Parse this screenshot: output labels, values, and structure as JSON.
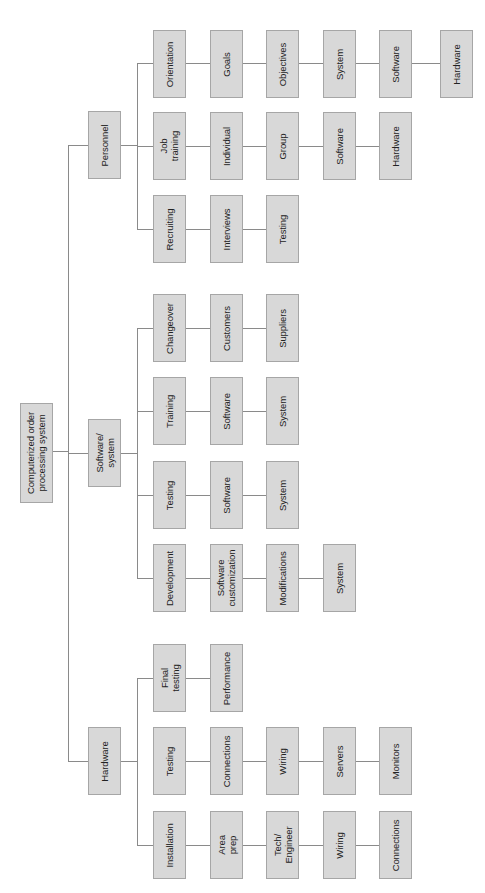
{
  "diagram": {
    "type": "work-breakdown-structure",
    "orientation": "rotated-90-ccw",
    "colors": {
      "box_fill": "#d8d8d8",
      "box_border": "#a6a6a6",
      "line": "#8a8a8a",
      "text": "#222222"
    },
    "root": {
      "id": "root",
      "label": "Computerized order\nprocessing system",
      "x": 20,
      "y": 403,
      "w": 33,
      "h": 100
    },
    "nodes": [
      {
        "id": "personnel",
        "label": "Personnel",
        "x": 88,
        "y": 111,
        "w": 33,
        "h": 68
      },
      {
        "id": "software-system",
        "label": "Software/\nsystem",
        "x": 88,
        "y": 419,
        "w": 33,
        "h": 68
      },
      {
        "id": "hardware",
        "label": "Hardware",
        "x": 88,
        "y": 727,
        "w": 33,
        "h": 68
      },
      {
        "id": "p-orientation",
        "label": "Orientation",
        "x": 153,
        "y": 30,
        "w": 33,
        "h": 68
      },
      {
        "id": "p-goals",
        "label": "Goals",
        "x": 210,
        "y": 30,
        "w": 33,
        "h": 68
      },
      {
        "id": "p-objectives",
        "label": "Objectives",
        "x": 266,
        "y": 30,
        "w": 33,
        "h": 68
      },
      {
        "id": "p-o-system",
        "label": "System",
        "x": 323,
        "y": 30,
        "w": 33,
        "h": 68
      },
      {
        "id": "p-o-software",
        "label": "Software",
        "x": 379,
        "y": 30,
        "w": 33,
        "h": 68
      },
      {
        "id": "p-o-hardware",
        "label": "Hardware",
        "x": 440,
        "y": 30,
        "w": 33,
        "h": 68
      },
      {
        "id": "p-job-training",
        "label": "Job\ntraining",
        "x": 153,
        "y": 112,
        "w": 33,
        "h": 68
      },
      {
        "id": "p-individual",
        "label": "Individual",
        "x": 210,
        "y": 112,
        "w": 33,
        "h": 68
      },
      {
        "id": "p-group",
        "label": "Group",
        "x": 266,
        "y": 112,
        "w": 33,
        "h": 68
      },
      {
        "id": "p-j-software",
        "label": "Software",
        "x": 323,
        "y": 112,
        "w": 33,
        "h": 68
      },
      {
        "id": "p-j-hardware",
        "label": "Hardware",
        "x": 379,
        "y": 112,
        "w": 33,
        "h": 68
      },
      {
        "id": "p-recruiting",
        "label": "Recruiting",
        "x": 153,
        "y": 195,
        "w": 33,
        "h": 68
      },
      {
        "id": "p-interviews",
        "label": "Interviews",
        "x": 210,
        "y": 195,
        "w": 33,
        "h": 68
      },
      {
        "id": "p-r-testing",
        "label": "Testing",
        "x": 266,
        "y": 195,
        "w": 33,
        "h": 68
      },
      {
        "id": "s-changeover",
        "label": "Changeover",
        "x": 153,
        "y": 294,
        "w": 33,
        "h": 68
      },
      {
        "id": "s-customers",
        "label": "Customers",
        "x": 210,
        "y": 294,
        "w": 33,
        "h": 68
      },
      {
        "id": "s-suppliers",
        "label": "Suppliers",
        "x": 266,
        "y": 294,
        "w": 33,
        "h": 68
      },
      {
        "id": "s-training",
        "label": "Training",
        "x": 153,
        "y": 377,
        "w": 33,
        "h": 68
      },
      {
        "id": "s-t-software",
        "label": "Software",
        "x": 210,
        "y": 377,
        "w": 33,
        "h": 68
      },
      {
        "id": "s-t-system",
        "label": "System",
        "x": 266,
        "y": 377,
        "w": 33,
        "h": 68
      },
      {
        "id": "s-testing",
        "label": "Testing",
        "x": 153,
        "y": 461,
        "w": 33,
        "h": 68
      },
      {
        "id": "s-te-software",
        "label": "Software",
        "x": 210,
        "y": 461,
        "w": 33,
        "h": 68
      },
      {
        "id": "s-te-system",
        "label": "System",
        "x": 266,
        "y": 461,
        "w": 33,
        "h": 68
      },
      {
        "id": "s-development",
        "label": "Development",
        "x": 153,
        "y": 544,
        "w": 33,
        "h": 68
      },
      {
        "id": "s-software-customization",
        "label": "Software\ncustomization",
        "x": 210,
        "y": 544,
        "w": 33,
        "h": 68
      },
      {
        "id": "s-modifications",
        "label": "Modifications",
        "x": 266,
        "y": 544,
        "w": 33,
        "h": 68
      },
      {
        "id": "s-d-system",
        "label": "System",
        "x": 323,
        "y": 544,
        "w": 33,
        "h": 68
      },
      {
        "id": "h-final-testing",
        "label": "Final\ntesting",
        "x": 153,
        "y": 644,
        "w": 33,
        "h": 68
      },
      {
        "id": "h-performance",
        "label": "Performance",
        "x": 210,
        "y": 644,
        "w": 33,
        "h": 68
      },
      {
        "id": "h-testing",
        "label": "Testing",
        "x": 153,
        "y": 727,
        "w": 33,
        "h": 68
      },
      {
        "id": "h-connections",
        "label": "Connections",
        "x": 210,
        "y": 727,
        "w": 33,
        "h": 68
      },
      {
        "id": "h-t-wiring",
        "label": "Wiring",
        "x": 266,
        "y": 727,
        "w": 33,
        "h": 68
      },
      {
        "id": "h-servers",
        "label": "Servers",
        "x": 323,
        "y": 727,
        "w": 33,
        "h": 68
      },
      {
        "id": "h-monitors",
        "label": "Monitors",
        "x": 379,
        "y": 727,
        "w": 33,
        "h": 68
      },
      {
        "id": "h-installation",
        "label": "Installation",
        "x": 153,
        "y": 811,
        "w": 33,
        "h": 68
      },
      {
        "id": "h-area-prep",
        "label": "Area\nprep",
        "x": 210,
        "y": 811,
        "w": 33,
        "h": 68
      },
      {
        "id": "h-tech-engineer",
        "label": "Tech/\nEngineer",
        "x": 266,
        "y": 811,
        "w": 33,
        "h": 68
      },
      {
        "id": "h-i-wiring",
        "label": "Wiring",
        "x": 323,
        "y": 811,
        "w": 33,
        "h": 68
      },
      {
        "id": "h-i-connections",
        "label": "Connections",
        "x": 379,
        "y": 811,
        "w": 33,
        "h": 68
      }
    ],
    "lines": [
      {
        "d": "h",
        "x": 52,
        "y": 451,
        "len": 16
      },
      {
        "d": "v",
        "x": 68,
        "y": 145,
        "len": 617
      },
      {
        "d": "h",
        "x": 68,
        "y": 145,
        "len": 20
      },
      {
        "d": "h",
        "x": 68,
        "y": 453,
        "len": 20
      },
      {
        "d": "h",
        "x": 68,
        "y": 761,
        "len": 20
      },
      {
        "d": "h",
        "x": 121,
        "y": 145,
        "len": 16
      },
      {
        "d": "v",
        "x": 137,
        "y": 63,
        "len": 167
      },
      {
        "d": "h",
        "x": 137,
        "y": 63,
        "len": 16
      },
      {
        "d": "h",
        "x": 137,
        "y": 146,
        "len": 16
      },
      {
        "d": "h",
        "x": 137,
        "y": 229,
        "len": 16
      },
      {
        "d": "h",
        "x": 121,
        "y": 453,
        "len": 16
      },
      {
        "d": "v",
        "x": 137,
        "y": 328,
        "len": 251
      },
      {
        "d": "h",
        "x": 137,
        "y": 328,
        "len": 16
      },
      {
        "d": "h",
        "x": 137,
        "y": 411,
        "len": 16
      },
      {
        "d": "h",
        "x": 137,
        "y": 495,
        "len": 16
      },
      {
        "d": "h",
        "x": 137,
        "y": 578,
        "len": 16
      },
      {
        "d": "h",
        "x": 121,
        "y": 761,
        "len": 16
      },
      {
        "d": "v",
        "x": 137,
        "y": 678,
        "len": 168
      },
      {
        "d": "h",
        "x": 137,
        "y": 678,
        "len": 16
      },
      {
        "d": "h",
        "x": 137,
        "y": 845,
        "len": 16
      },
      {
        "d": "h",
        "x": 186,
        "y": 63,
        "len": 254
      },
      {
        "d": "h",
        "x": 186,
        "y": 146,
        "len": 193
      },
      {
        "d": "h",
        "x": 186,
        "y": 229,
        "len": 80
      },
      {
        "d": "h",
        "x": 186,
        "y": 328,
        "len": 80
      },
      {
        "d": "h",
        "x": 186,
        "y": 411,
        "len": 80
      },
      {
        "d": "h",
        "x": 186,
        "y": 495,
        "len": 80
      },
      {
        "d": "h",
        "x": 186,
        "y": 578,
        "len": 137
      },
      {
        "d": "h",
        "x": 186,
        "y": 678,
        "len": 24
      },
      {
        "d": "h",
        "x": 186,
        "y": 761,
        "len": 193
      },
      {
        "d": "h",
        "x": 186,
        "y": 845,
        "len": 193
      }
    ]
  }
}
